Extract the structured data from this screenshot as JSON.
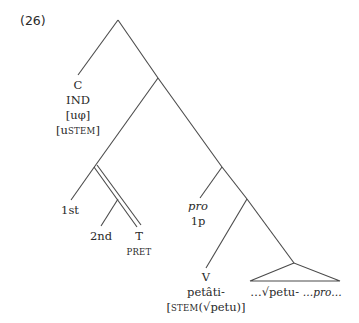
{
  "example_number": "(26)",
  "tree": {
    "c_node": {
      "category": "C",
      "feature1": "IND",
      "feature2": "[uφ]",
      "feature3_open": "[u",
      "feature3_sc": "STEM",
      "feature3_close": "]"
    },
    "first_node": {
      "label": "1st"
    },
    "second_node": {
      "label": "2nd"
    },
    "t_node": {
      "category": "T",
      "feature_sc": "PRET"
    },
    "pro_node": {
      "label": "pro",
      "feature": "1p"
    },
    "v_node": {
      "category": "V",
      "form": "petâti-",
      "feature_open": "[",
      "feature_sc": "STEM",
      "feature_rest": "(√petu)]"
    },
    "triangle_node": {
      "text_root": "…√petu-",
      "text_pro": "…pro…"
    }
  },
  "colors": {
    "line": "#4a4a4a",
    "text": "#2a2a2a",
    "background": "#ffffff"
  }
}
